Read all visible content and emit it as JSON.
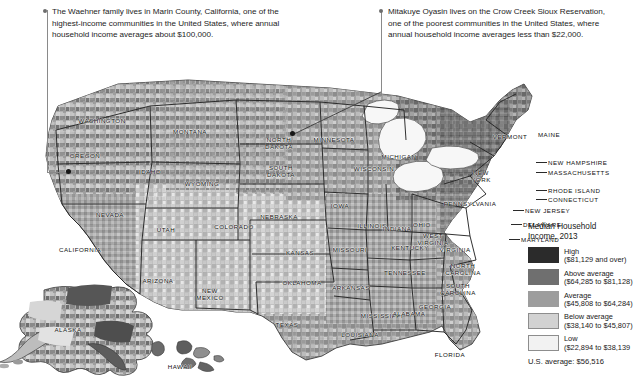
{
  "callouts": [
    {
      "id": "marin-county",
      "text": "The Waehner family lives in Marin County, California, one of the highest-income communities in the United States, where annual household income averages about $100,000."
    },
    {
      "id": "crow-creek",
      "text": "Mitakuye Oyasin lives on the Crow Creek Sioux Reservation, one of the poorest communities in the United States, where annual household income averages less than $22,000."
    }
  ],
  "legend": {
    "title": "Median Household\nIncome, 2013",
    "classes": [
      {
        "label": "High",
        "range": "($81,129 and over)",
        "color": "#2b2b2b"
      },
      {
        "label": "Above average",
        "range": "($64,285 to $81,128)",
        "color": "#6f6f6f"
      },
      {
        "label": "Average",
        "range": "($45,808 to $64,284)",
        "color": "#9d9d9d"
      },
      {
        "label": "Below average",
        "range": "($38,140 to $45,807)",
        "color": "#d2d2d2"
      },
      {
        "label": "Low",
        "range": "($22,894 to $38,139",
        "color": "#f2f2f2"
      }
    ],
    "us_average": "U.S. average: $56,516"
  },
  "map": {
    "states": [
      {
        "name": "WASHINGTON",
        "x": 102,
        "y": 76,
        "lines": [
          "WASHINGTON"
        ]
      },
      {
        "name": "OREGON",
        "x": 85,
        "y": 111,
        "lines": [
          "OREGON"
        ]
      },
      {
        "name": "IDAHO",
        "x": 150,
        "y": 127,
        "lines": [
          "IDAHO"
        ]
      },
      {
        "name": "MONTANA",
        "x": 190,
        "y": 87,
        "lines": [
          "MONTANA"
        ]
      },
      {
        "name": "WYOMING",
        "x": 202,
        "y": 139,
        "lines": [
          "WYOMING"
        ]
      },
      {
        "name": "NEVADA",
        "x": 110,
        "y": 170,
        "lines": [
          "NEVADA"
        ]
      },
      {
        "name": "UTAH",
        "x": 166,
        "y": 185,
        "lines": [
          "UTAH"
        ]
      },
      {
        "name": "CALIFORNIA",
        "x": 80,
        "y": 205,
        "lines": [
          "CALIFORNIA"
        ]
      },
      {
        "name": "ARIZONA",
        "x": 158,
        "y": 236,
        "lines": [
          "ARIZONA"
        ]
      },
      {
        "name": "COLORADO",
        "x": 234,
        "y": 182,
        "lines": [
          "COLORADO"
        ]
      },
      {
        "name": "NEW MEXICO",
        "x": 210,
        "y": 251,
        "lines": [
          "NEW",
          "MEXICO"
        ]
      },
      {
        "name": "NORTH DAKOTA",
        "x": 279,
        "y": 100,
        "lines": [
          "NORTH",
          "DAKOTA"
        ]
      },
      {
        "name": "SOUTH DAKOTA",
        "x": 281,
        "y": 128,
        "lines": [
          "SOUTH",
          "DAKOTA"
        ]
      },
      {
        "name": "NEBRASKA",
        "x": 279,
        "y": 172,
        "lines": [
          "NEBRASKA"
        ]
      },
      {
        "name": "KANSAS",
        "x": 300,
        "y": 208,
        "lines": [
          "KANSAS"
        ]
      },
      {
        "name": "OKLAHOMA",
        "x": 302,
        "y": 238,
        "lines": [
          "OKLAHOMA"
        ]
      },
      {
        "name": "TEXAS",
        "x": 287,
        "y": 280,
        "lines": [
          "TEXAS"
        ]
      },
      {
        "name": "MINNESOTA",
        "x": 334,
        "y": 95,
        "lines": [
          "MINNESOTA"
        ]
      },
      {
        "name": "IOWA",
        "x": 340,
        "y": 161,
        "lines": [
          "IOWA"
        ]
      },
      {
        "name": "MISSOURI",
        "x": 350,
        "y": 205,
        "lines": [
          "MISSOURI"
        ]
      },
      {
        "name": "ARKANSAS",
        "x": 351,
        "y": 243,
        "lines": [
          "ARKANSAS"
        ]
      },
      {
        "name": "LOUISIANA",
        "x": 360,
        "y": 290,
        "lines": [
          "LOUISIANA"
        ]
      },
      {
        "name": "WISCONSIN",
        "x": 374,
        "y": 124,
        "lines": [
          "WISCONSIN"
        ]
      },
      {
        "name": "ILLINOIS",
        "x": 372,
        "y": 181,
        "lines": [
          "ILLINOIS"
        ]
      },
      {
        "name": "MICHIGAN",
        "x": 399,
        "y": 112,
        "lines": [
          "MICHIGAN"
        ]
      },
      {
        "name": "INDIANA",
        "x": 397,
        "y": 184,
        "lines": [
          "INDIANA"
        ]
      },
      {
        "name": "OHIO",
        "x": 422,
        "y": 180,
        "lines": [
          "OHIO"
        ]
      },
      {
        "name": "KENTUCKY",
        "x": 410,
        "y": 203,
        "lines": [
          "KENTUCKY"
        ]
      },
      {
        "name": "TENNESSEE",
        "x": 405,
        "y": 228,
        "lines": [
          "TENNESSEE"
        ]
      },
      {
        "name": "MISSISSIPPI",
        "x": 382,
        "y": 271,
        "lines": [
          "MISSISSIPPI"
        ]
      },
      {
        "name": "ALABAMA",
        "x": 409,
        "y": 269,
        "lines": [
          "ALABAMA"
        ]
      },
      {
        "name": "GEORGIA",
        "x": 435,
        "y": 262,
        "lines": [
          "GEORGIA"
        ]
      },
      {
        "name": "FLORIDA",
        "x": 450,
        "y": 310,
        "lines": [
          "FLORIDA"
        ]
      },
      {
        "name": "SOUTH CAROLINA",
        "x": 458,
        "y": 246,
        "lines": [
          "SOUTH",
          "CAROLINA"
        ]
      },
      {
        "name": "NORTH CAROLINA",
        "x": 463,
        "y": 226,
        "lines": [
          "NORTH",
          "CAROLINA"
        ]
      },
      {
        "name": "VIRGINIA",
        "x": 455,
        "y": 205,
        "lines": [
          "VIRGINIA"
        ]
      },
      {
        "name": "WEST VIRGINIA",
        "x": 433,
        "y": 196,
        "lines": [
          "WEST",
          "VIRGINIA"
        ]
      },
      {
        "name": "PENNSYLVANIA",
        "x": 470,
        "y": 159,
        "lines": [
          "PENNSYLVANIA"
        ]
      },
      {
        "name": "NEW YORK",
        "x": 481,
        "y": 133,
        "lines": [
          "NEW",
          "YORK"
        ]
      },
      {
        "name": "VERMONT",
        "x": 510,
        "y": 92,
        "lines": [
          "VERMONT"
        ]
      },
      {
        "name": "MAINE",
        "x": 549,
        "y": 90,
        "lines": [
          "MAINE"
        ]
      },
      {
        "name": "ALASKA",
        "x": 68,
        "y": 285,
        "lines": [
          "ALASKA"
        ]
      },
      {
        "name": "HAWAII",
        "x": 180,
        "y": 322,
        "lines": [
          "HAWAII"
        ]
      }
    ],
    "callout_states": [
      {
        "name": "NEW HAMPSHIRE",
        "x": 548,
        "y": 118
      },
      {
        "name": "MASSACHUSETTS",
        "x": 548,
        "y": 128
      },
      {
        "name": "RHODE ISLAND",
        "x": 548,
        "y": 146
      },
      {
        "name": "CONNECTICUT",
        "x": 548,
        "y": 155
      },
      {
        "name": "NEW JERSEY",
        "x": 525,
        "y": 166
      },
      {
        "name": "DELAWARE",
        "x": 523,
        "y": 180
      },
      {
        "name": "MARYLAND",
        "x": 521,
        "y": 195
      }
    ]
  }
}
